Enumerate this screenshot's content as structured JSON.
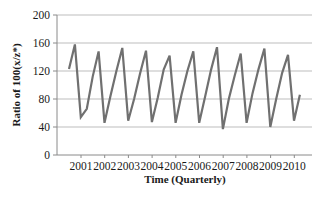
{
  "chart_data": {
    "type": "line",
    "title": "",
    "xlabel": "Time (Quarterly)",
    "ylabel": "Ratio of 100(x/z*)",
    "ylim": [
      0,
      200
    ],
    "yticks": [
      0,
      40,
      80,
      120,
      160,
      200
    ],
    "grid": true,
    "legend": "none",
    "x_tick_labels": [
      "2001",
      "2002",
      "2003",
      "2004",
      "2005",
      "2006",
      "2007",
      "2008",
      "2009",
      "2010"
    ],
    "series": [
      {
        "name": "Ratio of 100(x/z*)",
        "color": "#707070",
        "values": [
          123,
          158,
          54,
          66,
          112,
          148,
          46,
          84,
          120,
          153,
          49,
          80,
          116,
          149,
          47,
          82,
          122,
          142,
          46,
          86,
          120,
          148,
          46,
          84,
          122,
          154,
          37,
          80,
          114,
          145,
          46,
          88,
          122,
          152,
          40,
          80,
          117,
          143,
          49,
          86
        ]
      }
    ]
  },
  "colors": {
    "line": "#707070",
    "grid": "#bdbdbd",
    "axis": "#8a8a8a",
    "text": "#1a1a1a"
  }
}
